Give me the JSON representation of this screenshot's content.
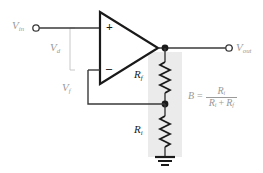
{
  "diagram": {
    "type": "circuit-schematic",
    "colors": {
      "wire": "#3a3a3a",
      "label_gray": "#9a9a9a",
      "label_dark": "#1a1a1a",
      "highlight_band": "#ebebeb",
      "node_fill": "#1a1a1a",
      "terminal_fill": "#ffffff"
    },
    "labels": {
      "v_in": "V",
      "v_in_sub": "in",
      "v_d": "V",
      "v_d_sub": "d",
      "v_f": "V",
      "v_f_sub": "f",
      "v_out": "V",
      "v_out_sub": "out",
      "r_f": "R",
      "r_f_sub": "f",
      "r_i": "R",
      "r_i_sub": "i",
      "opamp_plus": "+",
      "opamp_minus": "–"
    },
    "formula": {
      "lhs": "B",
      "equals": "=",
      "numerator": "R",
      "numerator_sub": "i",
      "denominator_first": "R",
      "denominator_first_sub": "i",
      "denominator_op": "+",
      "denominator_second": "R",
      "denominator_second_sub": "f"
    },
    "components": [
      {
        "name": "op-amp",
        "terminals": [
          "non-inverting +",
          "inverting –",
          "output"
        ]
      },
      {
        "name": "resistor-rf",
        "label": "Rf",
        "position": "feedback upper"
      },
      {
        "name": "resistor-ri",
        "label": "Ri",
        "position": "divider lower"
      },
      {
        "name": "ground",
        "symbol": "earth-ground"
      },
      {
        "name": "input-terminal",
        "symbol": "open-circle"
      },
      {
        "name": "output-terminal",
        "symbol": "open-circle"
      }
    ]
  }
}
